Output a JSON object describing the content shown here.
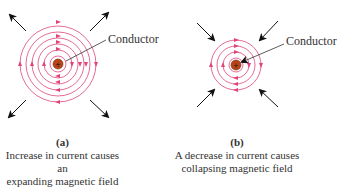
{
  "panels": [
    {
      "id": "a",
      "tag": "(a)",
      "caption_line1": "Increase in current causes an",
      "caption_line2": "expanding magnetic field",
      "conductor_label": "Conductor",
      "field_direction": "expanding",
      "ring_count": 6
    },
    {
      "id": "b",
      "tag": "(b)",
      "caption_line1": "A decrease in current causes",
      "caption_line2": "collapsing magnetic field",
      "conductor_label": "Conductor",
      "field_direction": "collapsing",
      "ring_count": 4
    }
  ],
  "colors": {
    "field_lines": "#e0447a",
    "conductor": "#b8441a",
    "arrows": "#111111",
    "text": "#333333"
  },
  "conductor_symbol": "+"
}
